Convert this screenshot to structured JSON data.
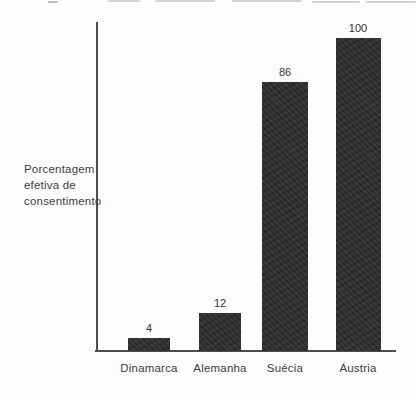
{
  "chart_data": {
    "type": "bar",
    "categories": [
      "Dinamarca",
      "Alemanha",
      "Suécia",
      "Áustria"
    ],
    "values": [
      4,
      12,
      86,
      100
    ],
    "data_labels": [
      "4",
      "12",
      "86",
      "100"
    ],
    "title": "",
    "xlabel": "",
    "ylabel": "Porcentagem efetiva de consentimento",
    "ylabel_lines": [
      "Porcentagem",
      "efetiva de",
      "consentimento"
    ],
    "ylim": [
      0,
      100
    ],
    "grid": false,
    "legend": null,
    "colors": {
      "bar": "#2c2c2c",
      "axis": "#4d4d4d",
      "text": "#3c3c3c",
      "background": "#fdfdfd"
    }
  }
}
